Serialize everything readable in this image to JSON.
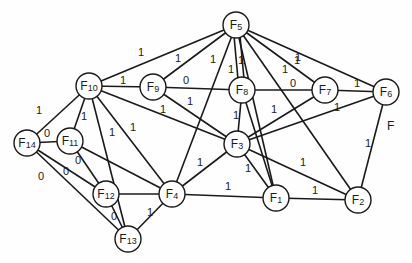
{
  "diagram": {
    "type": "weighted-undirected-graph",
    "node_radius": 13,
    "colors": {
      "stroke": "#1a1a1a",
      "node_fill": "#ffffff",
      "background": "#fefefe"
    },
    "nodes": [
      {
        "id": "F1",
        "prefix": "F",
        "sub": "1",
        "x": 276,
        "y": 198
      },
      {
        "id": "F2",
        "prefix": "F",
        "sub": "2",
        "x": 358,
        "y": 200
      },
      {
        "id": "F3",
        "prefix": "F",
        "sub": "3",
        "x": 237,
        "y": 144
      },
      {
        "id": "F4",
        "prefix": "F",
        "sub": "4",
        "x": 172,
        "y": 194
      },
      {
        "id": "F5",
        "prefix": "F",
        "sub": "5",
        "x": 236,
        "y": 25
      },
      {
        "id": "F6",
        "prefix": "F",
        "sub": "6",
        "x": 386,
        "y": 92
      },
      {
        "id": "F7",
        "prefix": "F",
        "sub": "7",
        "x": 325,
        "y": 90
      },
      {
        "id": "F8",
        "prefix": "F",
        "sub": "8",
        "x": 242,
        "y": 90
      },
      {
        "id": "F9",
        "prefix": "F",
        "sub": "9",
        "x": 153,
        "y": 87
      },
      {
        "id": "F10",
        "prefix": "F",
        "sub": "10",
        "x": 89,
        "y": 86
      },
      {
        "id": "F11",
        "prefix": "F",
        "sub": "11",
        "x": 70,
        "y": 141
      },
      {
        "id": "F12",
        "prefix": "F",
        "sub": "12",
        "x": 106,
        "y": 194
      },
      {
        "id": "F13",
        "prefix": "F",
        "sub": "13",
        "x": 128,
        "y": 239
      },
      {
        "id": "F14",
        "prefix": "F",
        "sub": "14",
        "x": 27,
        "y": 143
      }
    ],
    "edges": [
      {
        "from": "F10",
        "to": "F5",
        "label": "1",
        "lx": 141,
        "ly": 56
      },
      {
        "from": "F9",
        "to": "F5",
        "label": "1",
        "lx": 178,
        "ly": 62
      },
      {
        "from": "F10",
        "to": "F9",
        "label": "1",
        "lx": 123,
        "ly": 84
      },
      {
        "from": "F9",
        "to": "F8",
        "label": "0",
        "lx": 186,
        "ly": 84
      },
      {
        "from": "F9",
        "to": "F3",
        "label": "1",
        "lx": 190,
        "ly": 105
      },
      {
        "from": "F10",
        "to": "F3",
        "label": "1",
        "lx": 163,
        "ly": 113
      },
      {
        "from": "F10",
        "to": "F14",
        "label": "1",
        "lx": 39,
        "ly": 114
      },
      {
        "from": "F10",
        "to": "F11",
        "label": "1",
        "lx": 84,
        "ly": 120
      },
      {
        "from": "F10",
        "to": "F13",
        "label": "1",
        "lx": 112,
        "ly": 136
      },
      {
        "from": "F10",
        "to": "F4",
        "label": "1",
        "lx": 133,
        "ly": 131
      },
      {
        "from": "F14",
        "to": "F11",
        "label": "0",
        "lx": 47,
        "ly": 137
      },
      {
        "from": "F14",
        "to": "F12",
        "label": "0",
        "lx": 66,
        "ly": 175
      },
      {
        "from": "F14",
        "to": "F13",
        "label": "0",
        "lx": 41,
        "ly": 180
      },
      {
        "from": "F11",
        "to": "F12",
        "label": "0",
        "lx": 78,
        "ly": 164
      },
      {
        "from": "F11",
        "to": "F4",
        "label": "",
        "lx": 0,
        "ly": 0
      },
      {
        "from": "F12",
        "to": "F4",
        "label": "",
        "lx": 0,
        "ly": 0
      },
      {
        "from": "F12",
        "to": "F13",
        "label": "0",
        "lx": 114,
        "ly": 220
      },
      {
        "from": "F13",
        "to": "F4",
        "label": "1",
        "lx": 150,
        "ly": 216
      },
      {
        "from": "F5",
        "to": "F4",
        "label": "1",
        "lx": 213,
        "ly": 63
      },
      {
        "from": "F5",
        "to": "F8",
        "label": "1",
        "lx": 231,
        "ly": 73,
        "offset": -3
      },
      {
        "from": "F5",
        "to": "F8",
        "label": "1",
        "lx": 241,
        "ly": 64,
        "offset": 3
      },
      {
        "from": "F5",
        "to": "F1",
        "label": "",
        "lx": 0,
        "ly": 0
      },
      {
        "from": "F5",
        "to": "F2",
        "label": "1",
        "lx": 285,
        "ly": 73
      },
      {
        "from": "F5",
        "to": "F7",
        "label": "1",
        "lx": 297,
        "ly": 64
      },
      {
        "from": "F5",
        "to": "F6",
        "label": "1",
        "lx": 298,
        "ly": 61
      },
      {
        "from": "F8",
        "to": "F7",
        "label": "0",
        "lx": 293,
        "ly": 87
      },
      {
        "from": "F8",
        "to": "F3",
        "label": "1",
        "lx": 236,
        "ly": 119
      },
      {
        "from": "F8",
        "to": "F1",
        "label": "",
        "lx": 0,
        "ly": 0
      },
      {
        "from": "F7",
        "to": "F6",
        "label": "1",
        "lx": 357,
        "ly": 87
      },
      {
        "from": "F7",
        "to": "F3",
        "label": "1",
        "lx": 274,
        "ly": 113
      },
      {
        "from": "F6",
        "to": "F3",
        "label": "1",
        "lx": 337,
        "ly": 111
      },
      {
        "from": "F6",
        "to": "F2",
        "label": "1",
        "lx": 368,
        "ly": 147
      },
      {
        "from": "F3",
        "to": "F4",
        "label": "1",
        "lx": 200,
        "ly": 166
      },
      {
        "from": "F3",
        "to": "F1",
        "label": "1",
        "lx": 248,
        "ly": 172
      },
      {
        "from": "F3",
        "to": "F2",
        "label": "1",
        "lx": 303,
        "ly": 166
      },
      {
        "from": "F4",
        "to": "F1",
        "label": "1",
        "lx": 228,
        "ly": 190
      },
      {
        "from": "F1",
        "to": "F2",
        "label": "1",
        "lx": 315,
        "ly": 194
      }
    ],
    "free_labels": [
      {
        "text": "F",
        "x": 387,
        "y": 130
      }
    ]
  }
}
